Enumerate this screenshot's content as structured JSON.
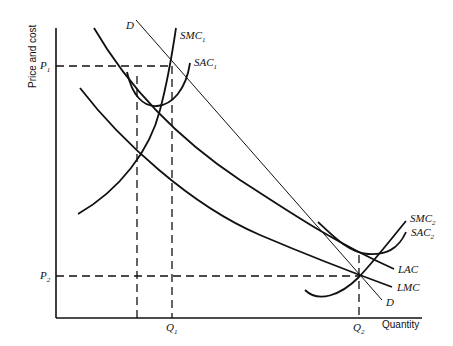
{
  "diagram": {
    "type": "economics-cost-curves",
    "y_axis_title": "Price and cost",
    "x_axis_title": "Quantity",
    "price_levels": [
      {
        "base": "P",
        "sub": "1"
      },
      {
        "base": "P",
        "sub": "2"
      }
    ],
    "quantity_levels": [
      {
        "base": "Q",
        "sub": "1"
      },
      {
        "base": "Q",
        "sub": "2"
      }
    ],
    "curves": {
      "demand_top": "D",
      "demand_bottom": "D",
      "smc1": {
        "base": "SMC",
        "sub": "1"
      },
      "sac1": {
        "base": "SAC",
        "sub": "1"
      },
      "smc2": {
        "base": "SMC",
        "sub": "2"
      },
      "sac2": {
        "base": "SAC",
        "sub": "2"
      },
      "lac": "LAC",
      "lmc": "LMC"
    },
    "colors": {
      "ink": "#111111",
      "background": "#ffffff"
    }
  }
}
